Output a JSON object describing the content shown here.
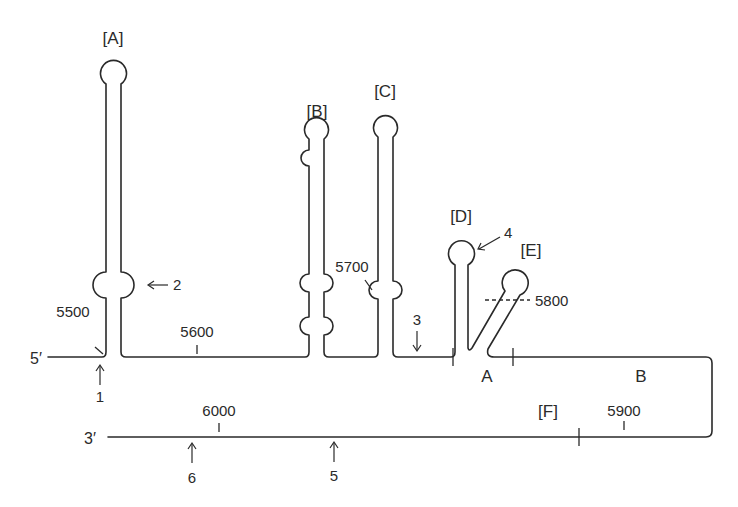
{
  "diagram": {
    "type": "RNA secondary structure",
    "ends": {
      "five_prime": "5′",
      "three_prime": "3′"
    },
    "hairpins": [
      {
        "id": "A",
        "label": "[A]"
      },
      {
        "id": "B",
        "label": "[B]"
      },
      {
        "id": "C",
        "label": "[C]"
      },
      {
        "id": "D",
        "label": "[D]"
      },
      {
        "id": "E",
        "label": "[E]"
      }
    ],
    "region_labels": {
      "F": "[F]",
      "A": "A",
      "B": "B"
    },
    "positions": {
      "p5500": "5500",
      "p5600": "5600",
      "p5700": "5700",
      "p5800": "5800",
      "p5900": "5900",
      "p6000": "6000"
    },
    "sites": {
      "s1": "1",
      "s2": "2",
      "s3": "3",
      "s4": "4",
      "s5": "5",
      "s6": "6"
    }
  }
}
